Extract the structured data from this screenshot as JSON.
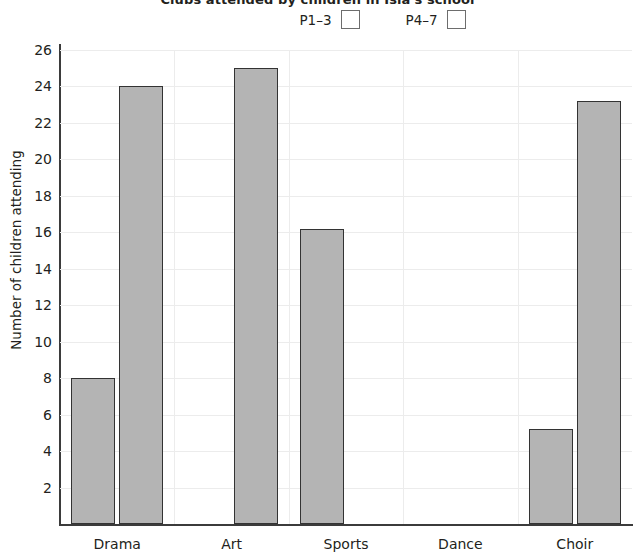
{
  "chart_data": {
    "type": "bar",
    "title": "Clubs attended by children in Isla's school",
    "xlabel": "",
    "ylabel": "Number of children attending",
    "categories": [
      "Drama",
      "Art",
      "Sports",
      "Dance",
      "Choir"
    ],
    "series": [
      {
        "name": "P1–3",
        "values": [
          8,
          0,
          16.2,
          0,
          5.2
        ],
        "color": "#b4b4b4"
      },
      {
        "name": "P4–7",
        "values": [
          24,
          25,
          0,
          0,
          23.2
        ],
        "color": "#b4b4b4"
      }
    ],
    "ylim": [
      0,
      26
    ],
    "ytick_step": 2,
    "yticks": [
      2,
      4,
      6,
      8,
      10,
      12,
      14,
      16,
      18,
      20,
      22,
      24,
      26
    ],
    "ytick_labels": [
      "2",
      "4",
      "6",
      "8",
      "10",
      "12",
      "14",
      "16",
      "18",
      "20",
      "22",
      "24",
      "26"
    ],
    "grid": true,
    "grid_color": "#ececec",
    "legend_position": "top",
    "legend": [
      {
        "label": "P1–3",
        "swatch_color": "#b4b4b4"
      },
      {
        "label": "P4–7",
        "swatch_color": "#b4b4b4"
      }
    ],
    "axis_color": "#3b3b3b",
    "bar_edge_color": "#333333",
    "note": "Dance has no bars drawn for either group"
  }
}
